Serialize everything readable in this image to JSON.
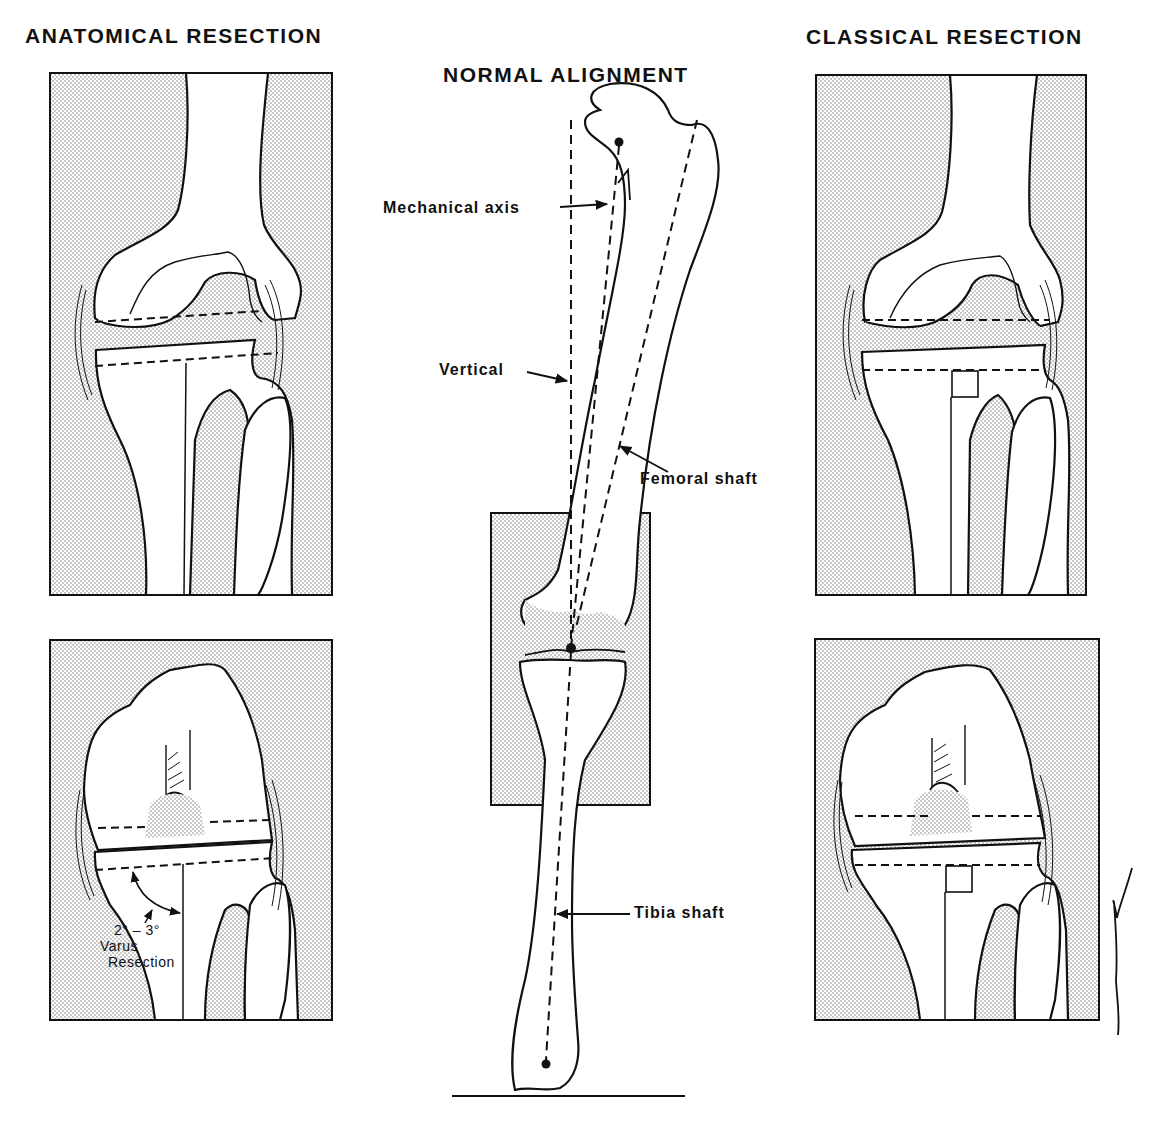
{
  "titles": {
    "left": "ANATOMICAL RESECTION",
    "center": "NORMAL ALIGNMENT",
    "right": "CLASSICAL RESECTION"
  },
  "center_labels": {
    "mechanical_axis": "Mechanical axis",
    "vertical": "Vertical",
    "femoral_shaft": "Femoral shaft",
    "tibia_shaft": "Tibia shaft"
  },
  "anatomical_annotation": {
    "angle": "2° – 3°",
    "line2": "Varus",
    "line3": "Resection"
  },
  "panels": [
    {
      "id": "anatomical-top",
      "view": "anterior knee, extension",
      "resection_lines": 2,
      "tibial_cut": "2-3 degree varus"
    },
    {
      "id": "anatomical-bottom",
      "view": "anterior knee, flexion",
      "resection_lines": 3,
      "tibial_cut": "2-3 degree varus"
    },
    {
      "id": "classical-top",
      "view": "anterior knee, extension",
      "resection_lines": 2,
      "tibial_cut": "perpendicular (square marker)"
    },
    {
      "id": "classical-bottom",
      "view": "anterior knee, flexion",
      "resection_lines": 3,
      "tibial_cut": "perpendicular (square marker)"
    }
  ],
  "colors": {
    "ink": "#111111",
    "stipple": "#8a8a8a",
    "paper": "#ffffff"
  }
}
